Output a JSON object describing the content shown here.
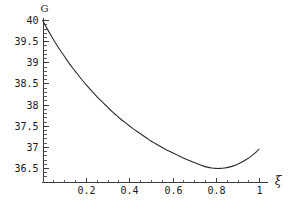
{
  "chart_data": {
    "type": "line",
    "title": "",
    "xlabel": "ξ",
    "ylabel": "G",
    "xlim": [
      0.0,
      1.04
    ],
    "ylim": [
      36.18,
      40.05
    ],
    "grid": false,
    "legend": null,
    "x_ticks": [
      {
        "value": 0.2,
        "label": "0.2"
      },
      {
        "value": 0.4,
        "label": "0.4"
      },
      {
        "value": 0.6,
        "label": "0.6"
      },
      {
        "value": 0.8,
        "label": "0.8"
      },
      {
        "value": 1.0,
        "label": "1"
      }
    ],
    "x_minor_step": 0.05,
    "y_ticks": [
      {
        "value": 36.5,
        "label": "36.5"
      },
      {
        "value": 37.0,
        "label": "37"
      },
      {
        "value": 37.5,
        "label": "37.5"
      },
      {
        "value": 38.0,
        "label": "38"
      },
      {
        "value": 38.5,
        "label": "38.5"
      },
      {
        "value": 39.0,
        "label": "39"
      },
      {
        "value": 39.5,
        "label": "39.5"
      },
      {
        "value": 40.0,
        "label": "40"
      }
    ],
    "y_minor_step": 0.1,
    "series": [
      {
        "name": "G",
        "color": "#2b2b2b",
        "x": [
          0.0,
          0.02,
          0.04,
          0.06,
          0.08,
          0.1,
          0.12,
          0.14,
          0.16,
          0.18,
          0.2,
          0.22,
          0.24,
          0.26,
          0.28,
          0.3,
          0.32,
          0.34,
          0.36,
          0.38,
          0.4,
          0.42,
          0.44,
          0.46,
          0.48,
          0.5,
          0.52,
          0.54,
          0.56,
          0.58,
          0.6,
          0.62,
          0.64,
          0.66,
          0.68,
          0.7,
          0.72,
          0.74,
          0.76,
          0.78,
          0.8,
          0.82,
          0.84,
          0.86,
          0.88,
          0.9,
          0.92,
          0.94,
          0.96,
          0.98,
          1.0
        ],
        "y": [
          40.0,
          39.81,
          39.63,
          39.46,
          39.3,
          39.15,
          39.0,
          38.86,
          38.73,
          38.6,
          38.48,
          38.36,
          38.25,
          38.14,
          38.04,
          37.94,
          37.84,
          37.75,
          37.66,
          37.58,
          37.5,
          37.42,
          37.35,
          37.28,
          37.21,
          37.14,
          37.08,
          37.02,
          36.96,
          36.91,
          36.86,
          36.81,
          36.76,
          36.71,
          36.67,
          36.63,
          36.59,
          36.55,
          36.52,
          36.5,
          36.49,
          36.49,
          36.5,
          36.52,
          36.55,
          36.59,
          36.64,
          36.7,
          36.77,
          36.85,
          36.95
        ]
      }
    ],
    "annotations": {
      "minimum_x": 0.81,
      "minimum_y": 36.49,
      "start_y": 40.0,
      "end_y": 36.95
    }
  }
}
